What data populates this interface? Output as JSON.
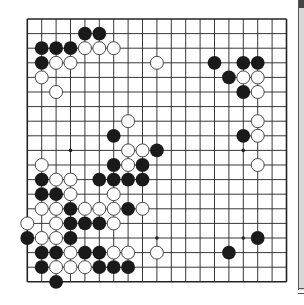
{
  "diagram": {
    "type": "go-board",
    "size": 19,
    "colors": {
      "board": "#ffffff",
      "line": "#222222",
      "black_stone": "#1a1a1a",
      "white_stone": "#ffffff",
      "white_outline": "#333333"
    },
    "star_points": [
      [
        3,
        9
      ],
      [
        15,
        9
      ],
      [
        9,
        15
      ],
      [
        15,
        15
      ]
    ],
    "black_stones": [
      [
        4,
        1
      ],
      [
        5,
        1
      ],
      [
        1,
        2
      ],
      [
        2,
        2
      ],
      [
        3,
        2
      ],
      [
        1,
        3
      ],
      [
        13,
        3
      ],
      [
        15,
        3
      ],
      [
        16,
        3
      ],
      [
        14,
        4
      ],
      [
        15,
        5
      ],
      [
        6,
        8
      ],
      [
        15,
        8
      ],
      [
        9,
        9
      ],
      [
        6,
        10
      ],
      [
        8,
        10
      ],
      [
        1,
        11
      ],
      [
        5,
        11
      ],
      [
        6,
        11
      ],
      [
        7,
        11
      ],
      [
        8,
        11
      ],
      [
        1,
        12
      ],
      [
        2,
        12
      ],
      [
        3,
        13
      ],
      [
        7,
        13
      ],
      [
        3,
        14
      ],
      [
        4,
        14
      ],
      [
        5,
        14
      ],
      [
        0,
        15
      ],
      [
        3,
        15
      ],
      [
        16,
        15
      ],
      [
        1,
        16
      ],
      [
        2,
        16
      ],
      [
        4,
        16
      ],
      [
        5,
        16
      ],
      [
        14,
        16
      ],
      [
        1,
        17
      ],
      [
        5,
        17
      ],
      [
        6,
        17
      ],
      [
        7,
        17
      ],
      [
        2,
        18
      ]
    ],
    "white_stones": [
      [
        4,
        2
      ],
      [
        5,
        2
      ],
      [
        6,
        2
      ],
      [
        2,
        3
      ],
      [
        3,
        3
      ],
      [
        9,
        3
      ],
      [
        1,
        4
      ],
      [
        15,
        4
      ],
      [
        16,
        4
      ],
      [
        16,
        5
      ],
      [
        2,
        5
      ],
      [
        7,
        7
      ],
      [
        16,
        7
      ],
      [
        16,
        8
      ],
      [
        7,
        9
      ],
      [
        8,
        9
      ],
      [
        1,
        10
      ],
      [
        7,
        10
      ],
      [
        16,
        10
      ],
      [
        2,
        11
      ],
      [
        3,
        11
      ],
      [
        3,
        12
      ],
      [
        6,
        12
      ],
      [
        1,
        13
      ],
      [
        2,
        13
      ],
      [
        4,
        13
      ],
      [
        5,
        13
      ],
      [
        6,
        13
      ],
      [
        8,
        13
      ],
      [
        0,
        14
      ],
      [
        2,
        14
      ],
      [
        6,
        14
      ],
      [
        1,
        15
      ],
      [
        2,
        15
      ],
      [
        3,
        16
      ],
      [
        6,
        16
      ],
      [
        7,
        16
      ],
      [
        9,
        16
      ],
      [
        2,
        17
      ],
      [
        3,
        17
      ],
      [
        4,
        17
      ]
    ]
  }
}
